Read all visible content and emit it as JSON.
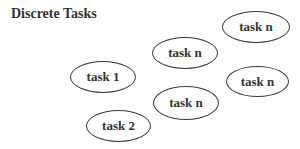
{
  "title": "Discrete Tasks",
  "tasks": [
    {
      "label": "task n",
      "x": 222,
      "y": 11,
      "w": 68,
      "h": 32
    },
    {
      "label": "task n",
      "x": 152,
      "y": 37,
      "w": 66,
      "h": 32
    },
    {
      "label": "task 1",
      "x": 70,
      "y": 61,
      "w": 66,
      "h": 32
    },
    {
      "label": "task n",
      "x": 226,
      "y": 66,
      "w": 63,
      "h": 31
    },
    {
      "label": "task n",
      "x": 153,
      "y": 86,
      "w": 66,
      "h": 34
    },
    {
      "label": "task 2",
      "x": 86,
      "y": 110,
      "w": 65,
      "h": 32
    }
  ]
}
